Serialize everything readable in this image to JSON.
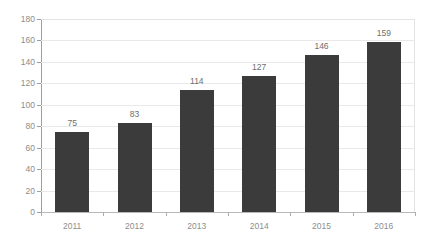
{
  "chart_data": {
    "type": "bar",
    "title": "",
    "subtitle": "",
    "xlabel": "",
    "ylabel": "",
    "categories": [
      "2011",
      "2012",
      "2013",
      "2014",
      "2015",
      "2016"
    ],
    "values": [
      75,
      83,
      114,
      127,
      146,
      159
    ],
    "data_labels": [
      "75",
      "83",
      "114",
      "127",
      "146",
      "159"
    ],
    "ylim": [
      0,
      180
    ],
    "ytick_step": 20,
    "ytick_labels": [
      "180",
      "160",
      "140",
      "120",
      "100",
      "80",
      "60",
      "40",
      "20",
      "0"
    ],
    "ytick_values": [
      180,
      160,
      140,
      120,
      100,
      80,
      60,
      40,
      20,
      0
    ],
    "grid": "horizontal",
    "legend": "none",
    "series": [
      {
        "name": "",
        "values": [
          75,
          83,
          114,
          127,
          146,
          159
        ]
      }
    ],
    "colors": {
      "bar": "#3b3b3b",
      "grid": "#e9e9e9",
      "axis": "#9e9e9e",
      "tick_label": "#8d8d8d",
      "data_label": "#6e6e6e",
      "background": "#ffffff"
    }
  }
}
